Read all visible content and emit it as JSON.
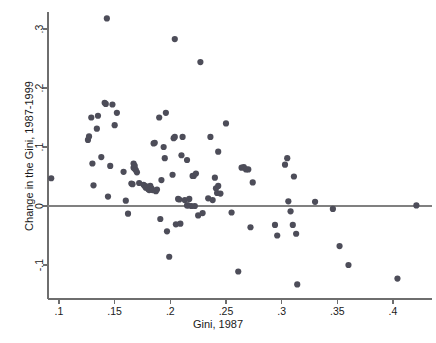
{
  "figure": {
    "background": "#ffffff",
    "width": 436,
    "height": 343
  },
  "axis_title_x": "Gini, 1987",
  "axis_title_y": "Change in the Gini, 1987-1999",
  "chart_data": {
    "type": "scatter",
    "title": "",
    "xlabel": "Gini, 1987",
    "ylabel": "Change in the Gini, 1987-1999",
    "xlim": [
      0.085,
      0.432
    ],
    "ylim": [
      -0.145,
      0.335
    ],
    "xticks": [
      0.1,
      0.15,
      0.2,
      0.25,
      0.3,
      0.35,
      0.4
    ],
    "xticklabels": [
      ".1",
      ".15",
      ".2",
      ".25",
      ".3",
      ".35",
      ".4"
    ],
    "yticks": [
      -0.1,
      0,
      0.1,
      0.2,
      0.3
    ],
    "yticklabels": [
      "-.1",
      "0",
      ".1",
      ".2",
      ".3"
    ],
    "grid": false,
    "legend": null,
    "marker": {
      "shape": "circle",
      "color": "#4d4d59",
      "size_px": 3.1
    },
    "reference_line": {
      "orientation": "horizontal",
      "y": 0,
      "color": "#808080",
      "width_px": 1.6
    },
    "n_points": 106,
    "points": [
      [
        0.093,
        0.047
      ],
      [
        0.126,
        0.112
      ],
      [
        0.127,
        0.118
      ],
      [
        0.129,
        0.15
      ],
      [
        0.13,
        0.072
      ],
      [
        0.131,
        0.035
      ],
      [
        0.134,
        0.131
      ],
      [
        0.135,
        0.153
      ],
      [
        0.138,
        0.083
      ],
      [
        0.141,
        0.175
      ],
      [
        0.142,
        0.173
      ],
      [
        0.143,
        0.318
      ],
      [
        0.144,
        0.016
      ],
      [
        0.146,
        0.068
      ],
      [
        0.148,
        0.172
      ],
      [
        0.15,
        0.137
      ],
      [
        0.152,
        0.158
      ],
      [
        0.158,
        0.058
      ],
      [
        0.16,
        0.009
      ],
      [
        0.162,
        -0.013
      ],
      [
        0.165,
        0.038
      ],
      [
        0.166,
        0.037
      ],
      [
        0.167,
        0.072
      ],
      [
        0.167,
        0.065
      ],
      [
        0.168,
        0.063
      ],
      [
        0.168,
        0.068
      ],
      [
        0.169,
        0.061
      ],
      [
        0.17,
        0.057
      ],
      [
        0.172,
        0.039
      ],
      [
        0.176,
        0.036
      ],
      [
        0.177,
        0.034
      ],
      [
        0.178,
        0.031
      ],
      [
        0.179,
        0.033
      ],
      [
        0.18,
        0.029
      ],
      [
        0.181,
        0.027
      ],
      [
        0.182,
        0.034
      ],
      [
        0.183,
        0.03
      ],
      [
        0.184,
        0.027
      ],
      [
        0.185,
        0.106
      ],
      [
        0.186,
        0.107
      ],
      [
        0.187,
        0.025
      ],
      [
        0.188,
        0.028
      ],
      [
        0.19,
        0.15
      ],
      [
        0.191,
        -0.022
      ],
      [
        0.192,
        0.044
      ],
      [
        0.194,
        0.1
      ],
      [
        0.195,
        0.081
      ],
      [
        0.196,
        0.158
      ],
      [
        0.197,
        -0.043
      ],
      [
        0.199,
        -0.086
      ],
      [
        0.202,
        0.053
      ],
      [
        0.203,
        0.115
      ],
      [
        0.204,
        0.117
      ],
      [
        0.205,
        -0.031
      ],
      [
        0.207,
        0.012
      ],
      [
        0.208,
        0.011
      ],
      [
        0.209,
        -0.03
      ],
      [
        0.21,
        0.086
      ],
      [
        0.211,
        0.117
      ],
      [
        0.213,
        0.01
      ],
      [
        0.215,
        0.078
      ],
      [
        0.216,
        0.001
      ],
      [
        0.217,
        0.012
      ],
      [
        0.219,
        0.0
      ],
      [
        0.22,
        0.051
      ],
      [
        0.221,
        0.051
      ],
      [
        0.222,
        0.0
      ],
      [
        0.223,
        0.055
      ],
      [
        0.225,
        -0.016
      ],
      [
        0.227,
        0.244
      ],
      [
        0.229,
        -0.012
      ],
      [
        0.234,
        0.013
      ],
      [
        0.236,
        0.117
      ],
      [
        0.238,
        0.01
      ],
      [
        0.24,
        0.048
      ],
      [
        0.241,
        0.03
      ],
      [
        0.242,
        0.022
      ],
      [
        0.243,
        0.034
      ],
      [
        0.243,
        0.092
      ],
      [
        0.245,
        0.021
      ],
      [
        0.25,
        0.14
      ],
      [
        0.255,
        -0.011
      ],
      [
        0.261,
        -0.111
      ],
      [
        0.264,
        0.065
      ],
      [
        0.266,
        0.066
      ],
      [
        0.268,
        0.062
      ],
      [
        0.27,
        0.062
      ],
      [
        0.272,
        -0.036
      ],
      [
        0.274,
        0.04
      ],
      [
        0.294,
        -0.032
      ],
      [
        0.296,
        -0.05
      ],
      [
        0.303,
        0.07
      ],
      [
        0.305,
        0.081
      ],
      [
        0.306,
        0.008
      ],
      [
        0.308,
        -0.009
      ],
      [
        0.31,
        -0.032
      ],
      [
        0.311,
        0.05
      ],
      [
        0.313,
        -0.047
      ],
      [
        0.314,
        -0.133
      ],
      [
        0.33,
        0.007
      ],
      [
        0.346,
        -0.005
      ],
      [
        0.352,
        -0.068
      ],
      [
        0.36,
        -0.1
      ],
      [
        0.404,
        -0.123
      ],
      [
        0.421,
        0.001
      ],
      [
        0.204,
        0.283
      ],
      [
        0.215,
        0.001
      ]
    ]
  }
}
